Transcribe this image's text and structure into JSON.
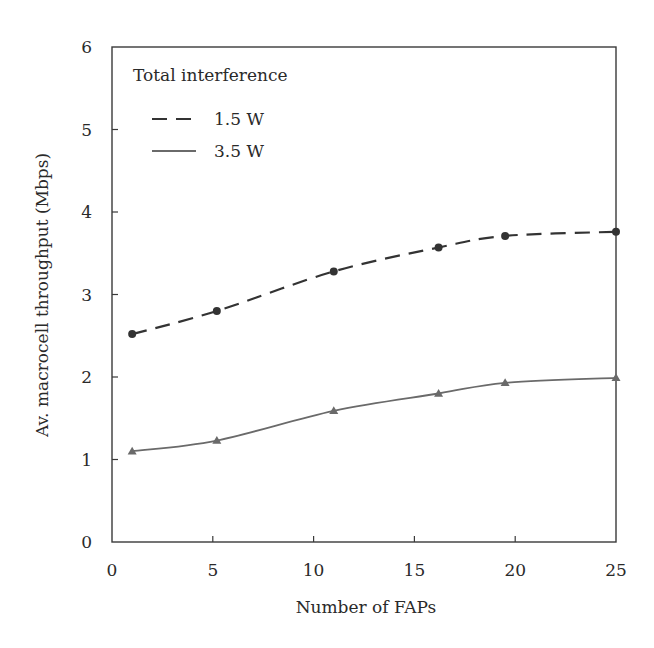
{
  "chart_data": {
    "type": "line",
    "title": "",
    "xlabel": "Number of FAPs",
    "ylabel": "Av. macrocell throughput (Mbps)",
    "xlim": [
      0,
      25
    ],
    "ylim": [
      0,
      6
    ],
    "xticks": [
      0,
      5,
      10,
      15,
      20,
      25
    ],
    "yticks": [
      0,
      1,
      2,
      3,
      4,
      5,
      6
    ],
    "grid": false,
    "legend": {
      "title": "Total interference",
      "position": "upper left",
      "entries": [
        "1.5 W",
        "3.5 W"
      ]
    },
    "x": [
      1,
      5.2,
      11,
      16.2,
      19.5,
      25
    ],
    "series": [
      {
        "name": "1.5 W",
        "values": [
          2.52,
          2.8,
          3.28,
          3.57,
          3.71,
          3.76
        ],
        "line_style": "dashed",
        "marker": "circle",
        "color": "#333333"
      },
      {
        "name": "3.5 W",
        "values": [
          1.1,
          1.23,
          1.59,
          1.8,
          1.93,
          1.99
        ],
        "line_style": "solid",
        "marker": "triangle",
        "color": "#6a6a6a"
      }
    ]
  }
}
